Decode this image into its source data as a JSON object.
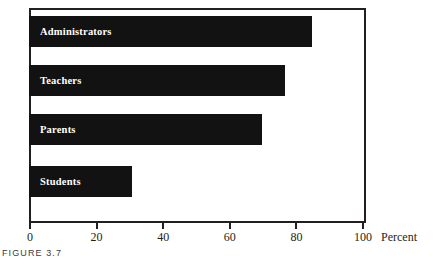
{
  "figure": {
    "caption": "FIGURE 3.7",
    "axis_title": "Percent"
  },
  "chart_data": {
    "type": "bar",
    "orientation": "horizontal",
    "title": "",
    "subtitle": "",
    "xlabel": "Percent",
    "ylabel": "",
    "categories": [
      "Administrators",
      "Teachers",
      "Parents",
      "Students"
    ],
    "values": [
      85,
      77,
      70,
      31
    ],
    "xlim": [
      0,
      100
    ],
    "xticks": [
      0,
      20,
      40,
      60,
      80,
      100
    ],
    "xtick_labels": [
      "0",
      "20",
      "40",
      "60",
      "80",
      "100"
    ],
    "grid": false,
    "legend": null,
    "bar_color": "#121212",
    "bar_label_color": "#ffffff",
    "axis_color": "#231f20",
    "background_color": "#ffffff",
    "series": [
      {
        "name": "Percent",
        "values": [
          85,
          77,
          70,
          31
        ]
      }
    ],
    "points": [
      {
        "category": "Administrators",
        "value": 85
      },
      {
        "category": "Teachers",
        "value": 77
      },
      {
        "category": "Parents",
        "value": 70
      },
      {
        "category": "Students",
        "value": 31
      }
    ]
  }
}
